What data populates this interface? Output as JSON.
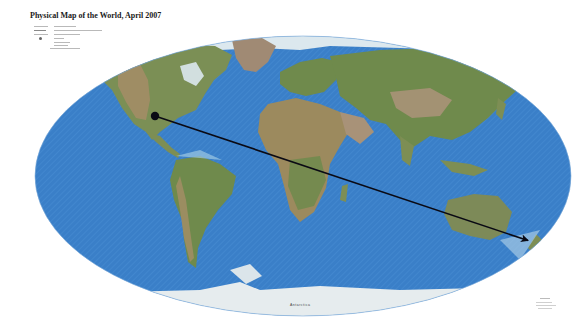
{
  "map": {
    "title": "Physical Map of the World, April 2007",
    "projection_shape": "ellipse",
    "ocean_color": "#3a7fc8",
    "ocean_shallow_color": "#8fbfe0",
    "land_lowland_color": "#6f8a4c",
    "land_highland_color": "#a08a64",
    "ice_color": "#e8eef2",
    "region_labels": {
      "antarctica": "Antarctica"
    }
  },
  "overlay": {
    "arrow": {
      "color": "#0a0a14",
      "start": {
        "x": 155,
        "y": 116
      },
      "end": {
        "x": 530,
        "y": 241
      },
      "start_marker": "dot",
      "end_marker": "arrowhead"
    }
  }
}
